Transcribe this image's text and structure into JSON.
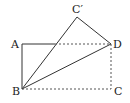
{
  "diagram": {
    "type": "geometry-fold",
    "points": {
      "A": {
        "label": "A",
        "x": 22,
        "y": 44
      },
      "B": {
        "label": "B",
        "x": 22,
        "y": 89
      },
      "C": {
        "label": "C",
        "x": 112,
        "y": 89
      },
      "D": {
        "label": "D",
        "x": 111,
        "y": 44
      },
      "C_prime": {
        "label": "C′",
        "x": 77,
        "y": 17
      },
      "E": {
        "label": "",
        "x": 55,
        "y": 44
      }
    },
    "segments_solid": [
      "A-E",
      "A-B",
      "B-C′",
      "C′-D",
      "B-D"
    ],
    "segments_dashed": [
      "E-D",
      "D-C",
      "B-C"
    ]
  }
}
